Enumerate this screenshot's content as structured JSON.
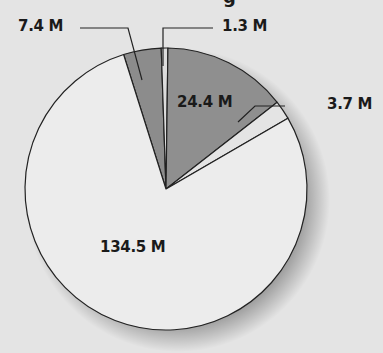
{
  "chart_data": {
    "type": "pie",
    "title": "",
    "start_angle_deg": -17.5,
    "direction": "clockwise",
    "slices": [
      {
        "label": "7.4 M",
        "value": 7.4,
        "color": "#8c8c8c"
      },
      {
        "label": "1.3 M",
        "value": 1.3,
        "color": "#dcdcdc"
      },
      {
        "label": "24.4 M",
        "value": 24.4,
        "color": "#8f8f8f"
      },
      {
        "label": "3.7 M",
        "value": 3.7,
        "color": "#e4e4e4"
      },
      {
        "label": "134.5 M",
        "value": 134.5,
        "color": "#ececec"
      }
    ],
    "total": 171.3,
    "legend": "none",
    "annotations": [
      "7.4 M",
      "1.3 M",
      "24.4 M",
      "3.7 M",
      "134.5 M"
    ]
  },
  "labels": {
    "s0": "7.4 M",
    "s1": "1.3 M",
    "s2": "24.4 M",
    "s3": "3.7 M",
    "s4": "134.5 M"
  },
  "title_fragment": "g"
}
